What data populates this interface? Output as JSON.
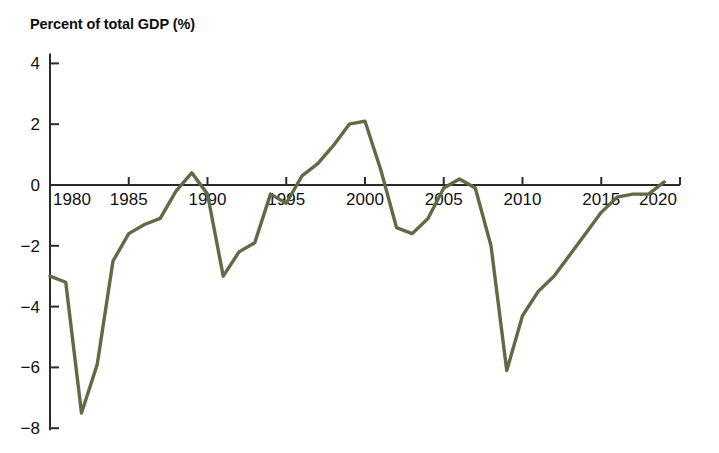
{
  "header": {
    "cut_off_line": "",
    "axis_title": "Percent of total GDP (%)"
  },
  "chart_data": {
    "type": "line",
    "title": "Percent of total GDP (%)",
    "xlabel": "",
    "ylabel": "Percent of total GDP (%)",
    "xlim": [
      1980,
      2020
    ],
    "ylim": [
      -8,
      4
    ],
    "xticks": [
      1980,
      1985,
      1990,
      1995,
      2000,
      2005,
      2010,
      2015,
      2020
    ],
    "yticks": [
      4,
      2,
      0,
      -2,
      -4,
      -6,
      -8
    ],
    "xtick_labels": [
      "1980",
      "1985",
      "1990",
      "1995",
      "2000",
      "2005",
      "2010",
      "2015",
      "2020"
    ],
    "ytick_labels": [
      "4",
      "2",
      "0",
      "−2",
      "−4",
      "−6",
      "−8"
    ],
    "grid": false,
    "legend": "none",
    "zero_line": true,
    "line_color": "#5f6b43",
    "line_width": 3.4,
    "x": [
      1980,
      1981,
      1982,
      1983,
      1984,
      1985,
      1986,
      1987,
      1988,
      1989,
      1990,
      1991,
      1992,
      1993,
      1994,
      1995,
      1996,
      1997,
      1998,
      1999,
      2000,
      2001,
      2002,
      2003,
      2004,
      2005,
      2006,
      2007,
      2008,
      2009,
      2010,
      2011,
      2012,
      2013,
      2014,
      2015,
      2016,
      2017,
      2018,
      2019
    ],
    "values": [
      -3.0,
      -3.2,
      -7.5,
      -5.9,
      -2.5,
      -1.6,
      -1.3,
      -1.1,
      -0.2,
      0.4,
      -0.3,
      -3.0,
      -2.2,
      -1.9,
      -0.3,
      -0.6,
      0.3,
      0.7,
      1.3,
      2.0,
      2.1,
      0.5,
      -1.4,
      -1.6,
      -1.1,
      -0.1,
      0.2,
      -0.1,
      -2.0,
      -6.1,
      -4.3,
      -3.5,
      -3.0,
      -2.3,
      -1.6,
      -0.9,
      -0.4,
      -0.3,
      -0.3,
      0.1
    ]
  }
}
